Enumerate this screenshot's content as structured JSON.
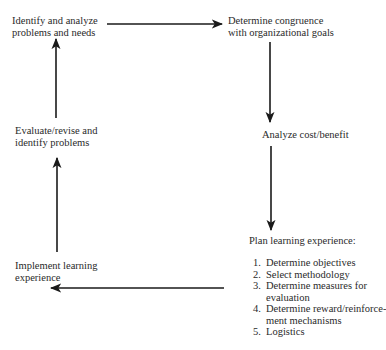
{
  "diagram": {
    "type": "cycle-flowchart",
    "nodes": [
      {
        "id": "identify",
        "lines": [
          "Identify and analyze",
          "problems and needs"
        ]
      },
      {
        "id": "congruence",
        "lines": [
          "Determine congruence",
          "with organizational goals"
        ]
      },
      {
        "id": "costbenefit",
        "lines": [
          "Analyze cost/benefit"
        ]
      },
      {
        "id": "plan",
        "lines": [
          "Plan learning experience:"
        ],
        "steps": [
          {
            "num": "1.",
            "lines": [
              "Determine objectives"
            ]
          },
          {
            "num": "2.",
            "lines": [
              "Select methodology"
            ]
          },
          {
            "num": "3.",
            "lines": [
              "Determine measures for",
              "evaluation"
            ]
          },
          {
            "num": "4.",
            "lines": [
              "Determine reward/reinforce-",
              "ment mechanisms"
            ]
          },
          {
            "num": "5.",
            "lines": [
              "Logistics"
            ]
          }
        ]
      },
      {
        "id": "implement",
        "lines": [
          "Implement learning",
          "experience"
        ]
      },
      {
        "id": "evaluate",
        "lines": [
          "Evaluate/revise and",
          "identify problems"
        ]
      }
    ],
    "edges": [
      {
        "from": "identify",
        "to": "congruence",
        "direction": "right"
      },
      {
        "from": "congruence",
        "to": "costbenefit",
        "direction": "down"
      },
      {
        "from": "costbenefit",
        "to": "plan",
        "direction": "down"
      },
      {
        "from": "plan",
        "to": "implement",
        "direction": "left"
      },
      {
        "from": "implement",
        "to": "evaluate",
        "direction": "up"
      },
      {
        "from": "evaluate",
        "to": "identify",
        "direction": "up"
      }
    ],
    "colors": {
      "line": "#1a1a1a",
      "text": "#2a2a2a",
      "background": "#ffffff"
    }
  }
}
